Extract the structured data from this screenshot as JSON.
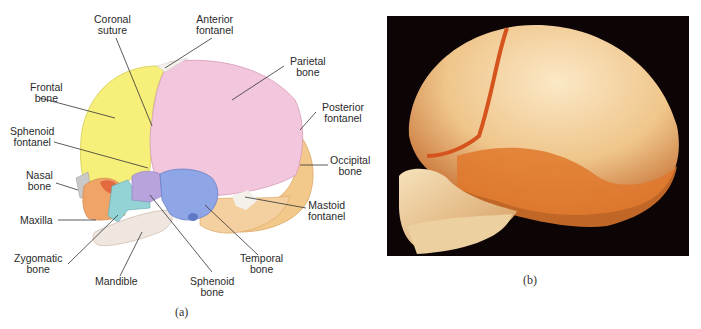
{
  "figure": {
    "panels": [
      {
        "id": "a",
        "caption": "(a)",
        "type": "labeled-illustration",
        "subject": "fetal skull, lateral view",
        "labels": {
          "coronal_suture": "Coronal\nsuture",
          "anterior_fontanel": "Anterior\nfontanel",
          "parietal_bone": "Parietal\nbone",
          "frontal_bone": "Frontal\nbone",
          "posterior_fontanel": "Posterior\nfontanel",
          "sphenoid_fontanel": "Sphenoid\nfontanel",
          "occipital_bone": "Occipital\nbone",
          "nasal_bone": "Nasal\nbone",
          "mastoid_fontanel": "Mastoid\nfontanel",
          "maxilla": "Maxilla",
          "zygomatic_bone": "Zygomatic\nbone",
          "temporal_bone": "Temporal\nbone",
          "mandible": "Mandible",
          "sphenoid_bone": "Sphenoid\nbone"
        },
        "colors": {
          "frontal": "#f6ef7a",
          "parietal": "#f2c6dc",
          "occipital": "#f2c98a",
          "temporal": "#8fa6e6",
          "sphenoid": "#b8a4dc",
          "zygomatic": "#93d3d6",
          "maxilla": "#f0a468",
          "mandible": "#efe6e0",
          "nasal": "#c9c9c9",
          "fontanel": "#f4f0ea"
        }
      },
      {
        "id": "b",
        "caption": "(b)",
        "type": "photograph",
        "subject": "fetal skull, lateral view"
      }
    ]
  }
}
